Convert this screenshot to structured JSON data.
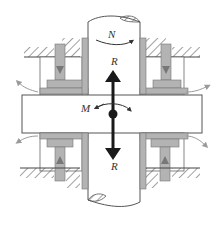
{
  "diagram": {
    "labels": {
      "rotation": "N",
      "force_top": "R",
      "force_bottom": "R",
      "moment": "M"
    },
    "colors": {
      "outline": "#555555",
      "pad_fill": "#b3b3b3",
      "pad_dark": "#8a8a8a",
      "force_arrow": "#1a1a1a",
      "flow_arrow": "#9a9a9a",
      "background": "#ffffff"
    },
    "components": [
      "shaft",
      "thrust-collar",
      "upper-left-pad",
      "upper-right-pad",
      "lower-left-pad",
      "lower-right-pad",
      "housing-hatch"
    ]
  }
}
